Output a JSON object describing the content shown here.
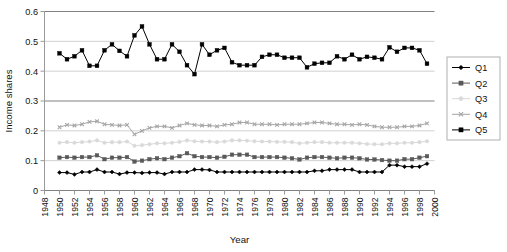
{
  "chart_data": {
    "type": "line",
    "title": "",
    "xlabel": "Year",
    "ylabel": "Income shares",
    "xlim": [
      1948,
      2000
    ],
    "ylim": [
      0,
      0.6
    ],
    "ytick_step": 0.1,
    "xtick_step": 2,
    "grid": true,
    "legend_position": "right",
    "yticks": [
      "0",
      "0.1",
      "0.2",
      "0.3",
      "0.4",
      "0.5",
      "0.6"
    ],
    "xticks": [
      "1948",
      "1950",
      "1952",
      "1954",
      "1956",
      "1958",
      "1960",
      "1962",
      "1964",
      "1966",
      "1968",
      "1970",
      "1972",
      "1974",
      "1976",
      "1978",
      "1980",
      "1982",
      "1984",
      "1986",
      "1988",
      "1990",
      "1992",
      "1994",
      "1996",
      "1998",
      "2000"
    ],
    "x": [
      1950,
      1951,
      1952,
      1953,
      1954,
      1955,
      1956,
      1957,
      1958,
      1959,
      1960,
      1961,
      1962,
      1963,
      1964,
      1965,
      1966,
      1967,
      1968,
      1969,
      1970,
      1971,
      1972,
      1973,
      1974,
      1975,
      1976,
      1977,
      1978,
      1979,
      1980,
      1981,
      1982,
      1983,
      1984,
      1985,
      1986,
      1987,
      1988,
      1989,
      1990,
      1991,
      1992,
      1993,
      1994,
      1995,
      1996,
      1997,
      1998,
      1999
    ],
    "series": [
      {
        "name": "Q1",
        "color": "#000000",
        "marker": "diamond",
        "values": [
          0.06,
          0.06,
          0.054,
          0.062,
          0.062,
          0.07,
          0.062,
          0.062,
          0.055,
          0.06,
          0.06,
          0.059,
          0.06,
          0.06,
          0.055,
          0.062,
          0.062,
          0.062,
          0.07,
          0.07,
          0.069,
          0.062,
          0.062,
          0.062,
          0.062,
          0.062,
          0.062,
          0.062,
          0.062,
          0.062,
          0.062,
          0.062,
          0.062,
          0.062,
          0.066,
          0.066,
          0.07,
          0.07,
          0.07,
          0.07,
          0.062,
          0.062,
          0.062,
          0.062,
          0.085,
          0.085,
          0.08,
          0.08,
          0.08,
          0.09
        ]
      },
      {
        "name": "Q2",
        "color": "#595959",
        "marker": "square",
        "values": [
          0.11,
          0.112,
          0.11,
          0.112,
          0.112,
          0.118,
          0.105,
          0.11,
          0.11,
          0.112,
          0.097,
          0.1,
          0.105,
          0.108,
          0.105,
          0.11,
          0.115,
          0.125,
          0.115,
          0.112,
          0.112,
          0.11,
          0.113,
          0.12,
          0.12,
          0.12,
          0.112,
          0.112,
          0.112,
          0.112,
          0.11,
          0.108,
          0.104,
          0.11,
          0.112,
          0.112,
          0.11,
          0.108,
          0.11,
          0.11,
          0.108,
          0.104,
          0.104,
          0.102,
          0.1,
          0.1,
          0.105,
          0.105,
          0.11,
          0.115
        ]
      },
      {
        "name": "Q3",
        "color": "#d9d9d9",
        "marker": "circle",
        "values": [
          0.16,
          0.162,
          0.16,
          0.162,
          0.164,
          0.168,
          0.16,
          0.162,
          0.162,
          0.164,
          0.15,
          0.152,
          0.155,
          0.158,
          0.158,
          0.16,
          0.163,
          0.168,
          0.165,
          0.164,
          0.164,
          0.162,
          0.164,
          0.168,
          0.168,
          0.167,
          0.165,
          0.164,
          0.164,
          0.163,
          0.163,
          0.162,
          0.158,
          0.16,
          0.162,
          0.162,
          0.16,
          0.16,
          0.16,
          0.16,
          0.158,
          0.156,
          0.155,
          0.155,
          0.158,
          0.158,
          0.16,
          0.16,
          0.162,
          0.165
        ]
      },
      {
        "name": "Q4",
        "color": "#a6a6a6",
        "marker": "cross",
        "values": [
          0.212,
          0.22,
          0.218,
          0.222,
          0.23,
          0.232,
          0.222,
          0.22,
          0.218,
          0.22,
          0.188,
          0.2,
          0.21,
          0.215,
          0.215,
          0.21,
          0.218,
          0.225,
          0.22,
          0.218,
          0.218,
          0.215,
          0.22,
          0.222,
          0.228,
          0.228,
          0.222,
          0.222,
          0.222,
          0.22,
          0.222,
          0.222,
          0.222,
          0.225,
          0.228,
          0.228,
          0.225,
          0.222,
          0.222,
          0.22,
          0.222,
          0.22,
          0.215,
          0.212,
          0.212,
          0.212,
          0.215,
          0.215,
          0.218,
          0.225
        ]
      },
      {
        "name": "Q5",
        "color": "#000000",
        "marker": "square",
        "values": [
          0.46,
          0.44,
          0.45,
          0.47,
          0.418,
          0.418,
          0.47,
          0.49,
          0.468,
          0.45,
          0.52,
          0.55,
          0.49,
          0.44,
          0.44,
          0.49,
          0.465,
          0.42,
          0.39,
          0.49,
          0.455,
          0.47,
          0.478,
          0.43,
          0.42,
          0.42,
          0.42,
          0.448,
          0.455,
          0.455,
          0.445,
          0.445,
          0.445,
          0.413,
          0.425,
          0.428,
          0.428,
          0.45,
          0.44,
          0.455,
          0.44,
          0.448,
          0.445,
          0.44,
          0.48,
          0.465,
          0.478,
          0.478,
          0.47,
          0.425
        ]
      }
    ]
  },
  "legend": {
    "items": [
      {
        "label": "Q1"
      },
      {
        "label": "Q2"
      },
      {
        "label": "Q3"
      },
      {
        "label": "Q4"
      },
      {
        "label": "Q5"
      }
    ]
  }
}
